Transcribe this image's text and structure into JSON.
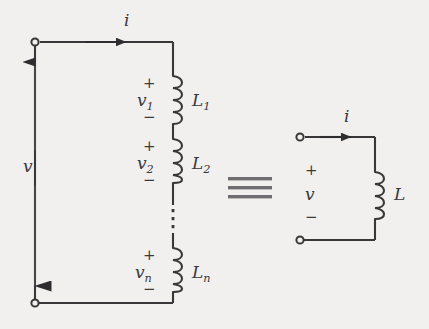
{
  "figure": {
    "type": "circuit-diagram",
    "background_color": "#f1f0ee",
    "ink_color": "#38383a",
    "equivalence_symbol": "≡"
  },
  "left_circuit": {
    "name": "series-inductor-network",
    "current_label": "i",
    "source_voltage_label": "v",
    "ellipsis": "⋮",
    "plus_sign": "+",
    "minus_sign": "−",
    "elements": [
      {
        "voltage_label": "v",
        "voltage_sub": "1",
        "inductor_label": "L",
        "inductor_sub": "1"
      },
      {
        "voltage_label": "v",
        "voltage_sub": "2",
        "inductor_label": "L",
        "inductor_sub": "2"
      },
      {
        "voltage_label": "v",
        "voltage_sub": "n",
        "inductor_label": "L",
        "inductor_sub": "n"
      }
    ]
  },
  "right_circuit": {
    "name": "equivalent-inductor",
    "current_label": "i",
    "voltage_label": "v",
    "inductor_label": "L",
    "plus_sign": "+",
    "minus_sign": "−"
  }
}
